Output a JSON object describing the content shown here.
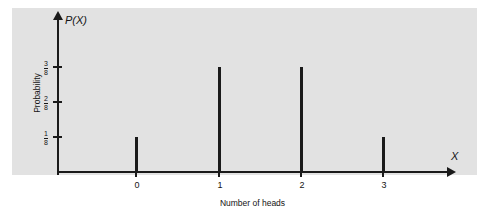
{
  "chart_data": {
    "type": "bar",
    "title": "",
    "subtitle": "",
    "xlabel": "Number of heads",
    "ylabel": "Probability",
    "y_axis_symbol": "P(X)",
    "x_axis_symbol": "X",
    "categories": [
      "0",
      "1",
      "2",
      "3"
    ],
    "values": [
      0.125,
      0.375,
      0.375,
      0.125
    ],
    "value_labels": [
      "1/8",
      "3/8",
      "3/8",
      "1/8"
    ],
    "ylim": [
      0,
      0.5
    ],
    "xlim": [
      -0.55,
      4.0
    ],
    "grid": false,
    "legend": null,
    "yticks": [
      {
        "value": 0.125,
        "label_num": "1",
        "label_den": "8"
      },
      {
        "value": 0.25,
        "label_num": "2",
        "label_den": "8"
      },
      {
        "value": 0.375,
        "label_num": "3",
        "label_den": "8"
      }
    ],
    "xticks": [
      "0",
      "1",
      "2",
      "3"
    ],
    "colors": {
      "panel_background": "#e2e2e2",
      "axis": "#1a1a1a",
      "spike": "#1a1a1a",
      "text": "#141414",
      "page_background": "#ffffff"
    }
  }
}
